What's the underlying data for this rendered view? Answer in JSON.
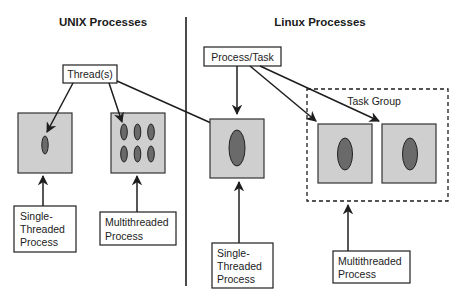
{
  "diagram": {
    "sections": {
      "unix": {
        "title": "UNIX Processes"
      },
      "linux": {
        "title": "Linux Processes"
      }
    },
    "unix": {
      "threads_label": "Thread(s)",
      "single_threaded_label": [
        "Single-",
        "Threaded",
        "Process"
      ],
      "multithreaded_label": [
        "Multithreaded",
        "Process"
      ],
      "single_process_thread_count": 1,
      "multi_process_thread_count": 6
    },
    "linux": {
      "process_task_label": "Process/Task",
      "task_group_label": "Task Group",
      "single_threaded_label": [
        "Single-",
        "Threaded",
        "Process"
      ],
      "multithreaded_label": [
        "Multithreaded",
        "Process"
      ],
      "task_group_member_count": 2
    },
    "colors": {
      "process_fill": "#cfcfcf",
      "thread_fill": "#6a6a6a",
      "line": "#1e1e1e"
    }
  }
}
